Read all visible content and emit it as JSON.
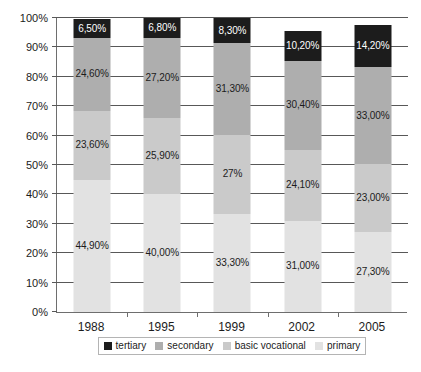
{
  "chart_data": {
    "type": "bar",
    "subtype": "stacked-percent",
    "title": "",
    "subtitle": "",
    "xlabel": "",
    "ylabel": "",
    "categories": [
      "1988",
      "1995",
      "1999",
      "2002",
      "2005"
    ],
    "ylim": [
      0,
      100
    ],
    "ytick_labels": [
      "0%",
      "10%",
      "20%",
      "30%",
      "40%",
      "50%",
      "60%",
      "70%",
      "80%",
      "90%",
      "100%"
    ],
    "ytick_values": [
      0,
      10,
      20,
      30,
      40,
      50,
      60,
      70,
      80,
      90,
      100
    ],
    "grid": true,
    "legend_position": "bottom",
    "stack_order_bottom_to_top": [
      "primary",
      "basic vocational",
      "secondary",
      "tertiary"
    ],
    "series": [
      {
        "name": "tertiary",
        "color": "#1c1c1c",
        "label_color": "#ffffff",
        "values": [
          6.5,
          6.8,
          8.3,
          10.2,
          14.2
        ],
        "labels": [
          "6,50%",
          "6,80%",
          "8,30%",
          "10,20%",
          "14,20%"
        ]
      },
      {
        "name": "secondary",
        "color": "#aeaeae",
        "label_color": "#1c1c1c",
        "values": [
          24.6,
          27.2,
          31.3,
          30.4,
          33.0
        ],
        "labels": [
          "24,60%",
          "27,20%",
          "31,30%",
          "30,40%",
          "33,00%"
        ]
      },
      {
        "name": "basic vocational",
        "color": "#cacaca",
        "label_color": "#1c1c1c",
        "values": [
          23.6,
          25.9,
          27.0,
          24.1,
          23.0
        ],
        "labels": [
          "23,60%",
          "25,90%",
          "27%",
          "24,10%",
          "23,00%"
        ]
      },
      {
        "name": "primary",
        "color": "#e2e2e2",
        "label_color": "#1c1c1c",
        "values": [
          44.9,
          40.0,
          33.3,
          31.0,
          27.3
        ],
        "labels": [
          "44,90%",
          "40,00%",
          "33,30%",
          "31,00%",
          "27,30%"
        ]
      }
    ]
  },
  "legend": {
    "items": [
      {
        "label": "tertiary",
        "color": "#1c1c1c"
      },
      {
        "label": "secondary",
        "color": "#aeaeae"
      },
      {
        "label": "basic vocational",
        "color": "#cacaca"
      },
      {
        "label": "primary",
        "color": "#e2e2e2"
      }
    ]
  },
  "colors": {
    "axis": "#6e6e6e",
    "gridline": "#585858",
    "background": "#ffffff",
    "text": "#1c1c1c",
    "legend_border": "#b4b4b4"
  }
}
